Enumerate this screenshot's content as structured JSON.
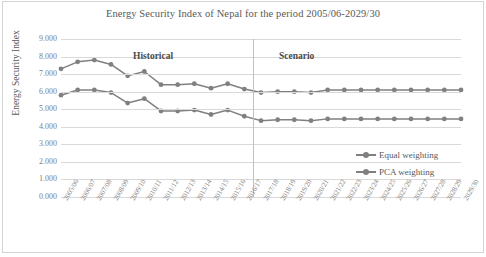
{
  "chart_data": {
    "type": "line",
    "title": "Energy Security Index of Nepal for the period 2005/06-2029/30",
    "xlabel": "",
    "ylabel": "Energy Security Index",
    "ylim": [
      0,
      9
    ],
    "ytick_labels": [
      "9.000",
      "8.000",
      "7.000",
      "6.000",
      "5.000",
      "4.000",
      "3.000",
      "2.000",
      "1.000",
      "0.000"
    ],
    "ytick_values": [
      9,
      8,
      7,
      6,
      5,
      4,
      3,
      2,
      1,
      0
    ],
    "grid": true,
    "legend_position": "right-inside",
    "categories": [
      "2005/06",
      "2006/07",
      "2007/08",
      "2008/09",
      "2009/10",
      "2010/11",
      "2011/12",
      "2012/13",
      "2013/14",
      "2014/15",
      "2015/16",
      "2016/17",
      "2017/18",
      "2018/19",
      "2019/20",
      "2020/21",
      "2021/22",
      "2022/23",
      "2023/24",
      "2024/25",
      "2025/26",
      "2026/27",
      "2027/28",
      "2028/29",
      "2029/30"
    ],
    "series": [
      {
        "name": "Equal weighting",
        "color": "#808080",
        "values": [
          7.3,
          7.7,
          7.8,
          7.55,
          6.9,
          7.15,
          6.4,
          6.4,
          6.45,
          6.2,
          6.45,
          6.15,
          5.95,
          6.0,
          6.0,
          5.95,
          6.1,
          6.1,
          6.1,
          6.1,
          6.1,
          6.1,
          6.1,
          6.1,
          6.1
        ]
      },
      {
        "name": "PCA weighting",
        "color": "#808080",
        "values": [
          5.8,
          6.1,
          6.1,
          5.95,
          5.35,
          5.6,
          4.9,
          4.9,
          4.95,
          4.7,
          4.95,
          4.6,
          4.35,
          4.4,
          4.4,
          4.35,
          4.45,
          4.45,
          4.45,
          4.45,
          4.45,
          4.45,
          4.45,
          4.45,
          4.45
        ]
      }
    ],
    "annotations": [
      {
        "text": "Historical",
        "region": "left"
      },
      {
        "text": "Scenario",
        "region": "right"
      }
    ],
    "divider_after_category": "2016/17"
  },
  "legend": {
    "items": [
      {
        "label": "Equal weighting"
      },
      {
        "label": "PCA weighting"
      }
    ]
  },
  "colors": {
    "series": "#808080",
    "grid": "#d9d9d9",
    "text": "#595959",
    "divider": "#bfbfbf"
  }
}
